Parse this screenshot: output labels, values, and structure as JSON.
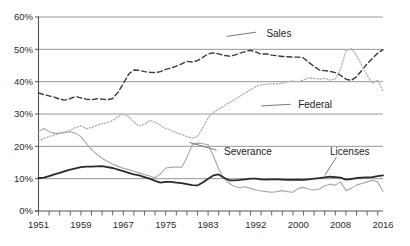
{
  "chart_data": {
    "type": "line",
    "title": "",
    "subtitle": "",
    "xlabel": "",
    "ylabel": "",
    "xlim": [
      1951,
      2016
    ],
    "ylim": [
      0,
      60
    ],
    "grid": true,
    "grid_axis": "y",
    "legend_position": "inline-annotations",
    "y_tick_labels": [
      "0%",
      "10%",
      "20%",
      "30%",
      "40%",
      "50%",
      "60%"
    ],
    "y_ticks": [
      0,
      10,
      20,
      30,
      40,
      50,
      60
    ],
    "x_tick_labels": [
      "1951",
      "1959",
      "1967",
      "1975",
      "1983",
      "1992",
      "2000",
      "2008",
      "2016"
    ],
    "x_ticks": [
      1951,
      1959,
      1967,
      1975,
      1983,
      1992,
      2000,
      2008,
      2016
    ],
    "x_minor_tick_interval": 2,
    "value_unit": "percent",
    "series": [
      {
        "name": "Sales",
        "style": "dashed",
        "color": "#3a3a3a",
        "label_x": 1994,
        "label_y": 55,
        "x": [
          1951,
          1952,
          1953,
          1954,
          1955,
          1956,
          1957,
          1958,
          1959,
          1960,
          1961,
          1962,
          1963,
          1964,
          1965,
          1966,
          1967,
          1968,
          1969,
          1970,
          1971,
          1972,
          1973,
          1974,
          1975,
          1976,
          1977,
          1978,
          1979,
          1980,
          1981,
          1982,
          1983,
          1984,
          1985,
          1986,
          1987,
          1988,
          1989,
          1990,
          1991,
          1992,
          1993,
          1994,
          1995,
          1996,
          1997,
          1998,
          1999,
          2000,
          2001,
          2002,
          2003,
          2004,
          2005,
          2006,
          2007,
          2008,
          2009,
          2010,
          2011,
          2012,
          2013,
          2014,
          2015,
          2016
        ],
        "values": [
          36.5,
          36.0,
          35.6,
          35.2,
          34.6,
          34.3,
          34.8,
          35.4,
          35.0,
          34.6,
          34.4,
          34.7,
          34.6,
          34.4,
          34.8,
          36.7,
          39.4,
          42.3,
          43.6,
          43.5,
          43.1,
          42.9,
          42.8,
          43.1,
          43.8,
          44.2,
          44.8,
          45.5,
          46.3,
          46.1,
          46.5,
          47.5,
          48.6,
          48.9,
          48.6,
          48.1,
          47.9,
          48.2,
          48.8,
          49.3,
          49.7,
          49.2,
          48.5,
          48.6,
          48.2,
          48.0,
          47.8,
          47.7,
          47.6,
          47.6,
          47.3,
          46.0,
          44.7,
          43.6,
          43.4,
          43.2,
          42.8,
          42.0,
          40.8,
          40.4,
          41.5,
          43.5,
          45.5,
          47.2,
          48.8,
          49.9
        ]
      },
      {
        "name": "Federal",
        "style": "dotted",
        "color": "#b0b0b0",
        "label_x": 2000,
        "label_y": 33,
        "x": [
          1951,
          1952,
          1953,
          1954,
          1955,
          1956,
          1957,
          1958,
          1959,
          1960,
          1961,
          1962,
          1963,
          1964,
          1965,
          1966,
          1967,
          1968,
          1969,
          1970,
          1971,
          1972,
          1973,
          1974,
          1975,
          1976,
          1977,
          1978,
          1979,
          1980,
          1981,
          1982,
          1983,
          1984,
          1985,
          1986,
          1987,
          1988,
          1989,
          1990,
          1991,
          1992,
          1993,
          1994,
          1995,
          1996,
          1997,
          1998,
          1999,
          2000,
          2001,
          2002,
          2003,
          2004,
          2005,
          2006,
          2007,
          2008,
          2009,
          2010,
          2011,
          2012,
          2013,
          2014,
          2015,
          2016
        ],
        "values": [
          21.5,
          22.5,
          23.0,
          23.5,
          24.0,
          24.5,
          25.0,
          25.8,
          26.3,
          25.5,
          25.8,
          26.5,
          27.0,
          27.3,
          28.0,
          29.2,
          30.0,
          29.2,
          27.5,
          26.3,
          26.8,
          28.0,
          27.5,
          26.5,
          25.5,
          25.0,
          24.2,
          23.7,
          23.0,
          22.5,
          23.0,
          25.8,
          28.8,
          30.5,
          31.5,
          32.5,
          33.5,
          34.5,
          35.5,
          36.5,
          37.5,
          38.5,
          39.0,
          39.2,
          39.4,
          39.3,
          39.5,
          40.0,
          40.2,
          40.0,
          40.5,
          41.2,
          41.0,
          40.8,
          41.0,
          40.5,
          40.8,
          44.0,
          49.5,
          50.2,
          48.2,
          45.0,
          42.0,
          39.5,
          40.5,
          37.0
        ]
      },
      {
        "name": "Severance",
        "style": "solid-light",
        "color": "#a8a8a8",
        "label_x": 1986,
        "label_y": 18.5,
        "x": [
          1951,
          1952,
          1953,
          1954,
          1955,
          1956,
          1957,
          1958,
          1959,
          1960,
          1961,
          1962,
          1963,
          1964,
          1965,
          1966,
          1967,
          1968,
          1969,
          1970,
          1971,
          1972,
          1973,
          1974,
          1975,
          1976,
          1977,
          1978,
          1979,
          1980,
          1981,
          1982,
          1983,
          1984,
          1985,
          1986,
          1987,
          1988,
          1989,
          1990,
          1991,
          1992,
          1993,
          1994,
          1995,
          1996,
          1997,
          1998,
          1999,
          2000,
          2001,
          2002,
          2003,
          2004,
          2005,
          2006,
          2007,
          2008,
          2009,
          2010,
          2011,
          2012,
          2013,
          2014,
          2015,
          2016
        ],
        "values": [
          24.5,
          25.5,
          24.5,
          24.0,
          24.0,
          24.3,
          24.5,
          24.0,
          23.0,
          21.0,
          19.0,
          17.5,
          16.3,
          15.3,
          14.5,
          13.8,
          13.2,
          12.8,
          12.3,
          11.8,
          11.3,
          10.8,
          10.3,
          11.5,
          13.3,
          13.5,
          13.6,
          13.5,
          16.5,
          20.5,
          21.0,
          20.8,
          20.5,
          17.0,
          13.0,
          10.0,
          8.5,
          7.6,
          7.2,
          7.5,
          7.0,
          6.5,
          6.2,
          6.0,
          5.8,
          6.0,
          6.3,
          6.0,
          5.8,
          7.0,
          7.3,
          6.8,
          6.5,
          6.8,
          7.8,
          8.3,
          8.0,
          9.0,
          6.3,
          7.0,
          8.0,
          8.5,
          9.0,
          9.5,
          9.0,
          6.0
        ]
      },
      {
        "name": "Licenses",
        "style": "solid-dark",
        "color": "#2a2a2a",
        "label_x": 2006,
        "label_y": 18.5,
        "x": [
          1951,
          1952,
          1953,
          1954,
          1955,
          1956,
          1957,
          1958,
          1959,
          1960,
          1961,
          1962,
          1963,
          1964,
          1965,
          1966,
          1967,
          1968,
          1969,
          1970,
          1971,
          1972,
          1973,
          1974,
          1975,
          1976,
          1977,
          1978,
          1979,
          1980,
          1981,
          1982,
          1983,
          1984,
          1985,
          1986,
          1987,
          1988,
          1989,
          1990,
          1991,
          1992,
          1993,
          1994,
          1995,
          1996,
          1997,
          1998,
          1999,
          2000,
          2001,
          2002,
          2003,
          2004,
          2005,
          2006,
          2007,
          2008,
          2009,
          2010,
          2011,
          2012,
          2013,
          2014,
          2015,
          2016
        ],
        "values": [
          10.2,
          10.3,
          10.8,
          11.3,
          11.8,
          12.3,
          12.8,
          13.2,
          13.6,
          13.7,
          13.7,
          13.8,
          13.9,
          13.6,
          13.3,
          12.8,
          12.3,
          11.8,
          11.3,
          11.0,
          10.5,
          10.0,
          9.3,
          8.8,
          9.0,
          9.0,
          8.8,
          8.6,
          8.3,
          8.0,
          7.9,
          8.8,
          10.0,
          11.0,
          11.3,
          10.3,
          9.5,
          9.5,
          9.6,
          9.8,
          10.0,
          10.0,
          9.8,
          9.7,
          9.8,
          9.8,
          9.7,
          9.6,
          9.6,
          9.7,
          9.6,
          9.8,
          10.0,
          10.2,
          10.4,
          10.6,
          10.5,
          10.3,
          9.7,
          9.9,
          10.2,
          10.3,
          10.4,
          10.5,
          10.8,
          11.0
        ]
      }
    ]
  },
  "axis": {
    "axis_color": "#555555",
    "grid_color": "#8a8a8a"
  }
}
